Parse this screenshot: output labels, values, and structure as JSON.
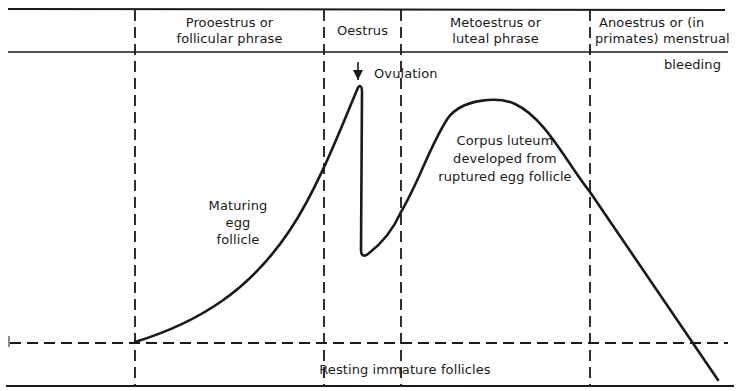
{
  "diagram": {
    "type": "oestrous-cycle-follicle-development",
    "phases": [
      {
        "id": "prooestrus",
        "lines": [
          "Prooestrus or",
          "follicular phrase"
        ]
      },
      {
        "id": "oestrus",
        "lines": [
          "Oestrus"
        ]
      },
      {
        "id": "metoestrus",
        "lines": [
          "Metoestrus or",
          "luteal phrase"
        ]
      },
      {
        "id": "anoestrus",
        "lines": [
          "Anoestrus or (in",
          "primates) menstrual",
          "bleeding"
        ]
      }
    ],
    "annotations": {
      "ovulation": "Ovulation",
      "maturing": [
        "Maturing",
        "egg",
        "follicle"
      ],
      "corpus_luteum": [
        "Corpus luteum",
        "developed from",
        "ruptured egg follicle"
      ],
      "resting": "Resting immature follicles"
    },
    "colors": {
      "ink": "#1a1a1a",
      "background": "#ffffff"
    }
  }
}
